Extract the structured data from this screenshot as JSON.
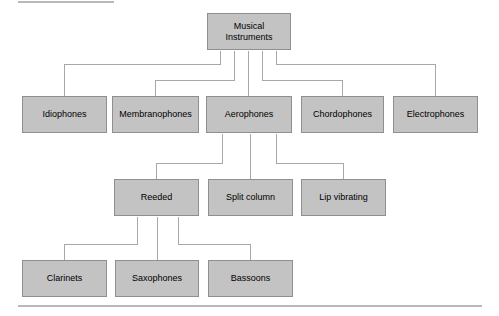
{
  "figure": {
    "type": "tree-diagram",
    "box_fill": "#c3c3c3",
    "box_border": "#8f8f8f",
    "connector_color": "#a8a8a8",
    "rule_color": "#b9b9b9",
    "background": "#ffffff"
  },
  "rules": {
    "top_rule": "",
    "bottom_rule": ""
  },
  "nodes": {
    "root": {
      "label": "Musical\nInstruments"
    },
    "level2": [
      {
        "label": "Idiophones"
      },
      {
        "label": "Membranophones"
      },
      {
        "label": "Aerophones"
      },
      {
        "label": "Chordophones"
      },
      {
        "label": "Electrophones"
      }
    ],
    "level3": [
      {
        "label": "Reeded"
      },
      {
        "label": "Split column"
      },
      {
        "label": "Lip vibrating"
      }
    ],
    "level4": [
      {
        "label": "Clarinets"
      },
      {
        "label": "Saxophones"
      },
      {
        "label": "Bassoons"
      }
    ]
  },
  "edges": [
    {
      "from": "Musical Instruments",
      "to": "Idiophones"
    },
    {
      "from": "Musical Instruments",
      "to": "Membranophones"
    },
    {
      "from": "Musical Instruments",
      "to": "Aerophones"
    },
    {
      "from": "Musical Instruments",
      "to": "Chordophones"
    },
    {
      "from": "Musical Instruments",
      "to": "Electrophones"
    },
    {
      "from": "Aerophones",
      "to": "Reeded"
    },
    {
      "from": "Aerophones",
      "to": "Split column"
    },
    {
      "from": "Aerophones",
      "to": "Lip vibrating"
    },
    {
      "from": "Reeded",
      "to": "Clarinets"
    },
    {
      "from": "Reeded",
      "to": "Saxophones"
    },
    {
      "from": "Reeded",
      "to": "Bassoons"
    }
  ]
}
